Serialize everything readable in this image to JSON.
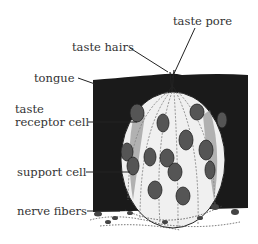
{
  "diagram": {
    "labels": {
      "taste_pore": "taste pore",
      "taste_hairs": "taste hairs",
      "tongue": "tongue",
      "taste_receptor_cell_line1": "taste",
      "taste_receptor_cell_line2": "receptor cell",
      "support_cell": "support cell",
      "nerve_fibers": "nerve fibers"
    },
    "colors": {
      "tongue_fill": "#1a1a1a",
      "bud_fill": "#f2f2f2",
      "nucleus_fill": "#555555",
      "line": "#222222"
    }
  }
}
